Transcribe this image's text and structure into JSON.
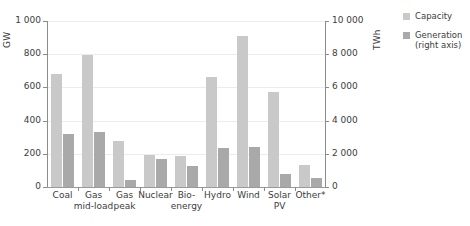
{
  "chart_data": {
    "type": "bar",
    "title": "",
    "xlabel": "",
    "categories": [
      "Coal",
      "Gas\nmid-load",
      "Gas\npeak",
      "Nuclear",
      "Bio-\nenergy",
      "Hydro",
      "Wind",
      "Solar\nPV",
      "Other*"
    ],
    "series": [
      {
        "name": "Capacity",
        "axis": "left",
        "unit": "GW",
        "color": "#c9c9c9",
        "values": [
          680,
          795,
          275,
          190,
          188,
          660,
          910,
          570,
          130
        ]
      },
      {
        "name": "Generation (right axis)",
        "axis": "right",
        "unit": "TWh",
        "color": "#a9a9a9",
        "values": [
          3200,
          3300,
          420,
          1700,
          1250,
          2350,
          2400,
          780,
          560
        ]
      }
    ],
    "left_axis": {
      "label": "GW",
      "ticks": [
        0,
        200,
        400,
        600,
        800,
        1000
      ],
      "tick_labels": [
        "0",
        "200",
        "400",
        "600",
        "800",
        "1 000"
      ],
      "ylim": [
        0,
        1000
      ]
    },
    "right_axis": {
      "label": "TWh",
      "ticks": [
        0,
        2000,
        4000,
        6000,
        8000,
        10000
      ],
      "tick_labels": [
        "0",
        "2 000",
        "4 000",
        "6 000",
        "8 000",
        "10 000"
      ],
      "ylim": [
        0,
        10000
      ]
    },
    "grid": true,
    "legend_position": "right",
    "legend": [
      {
        "label": "Capacity",
        "color": "#c9c9c9"
      },
      {
        "label": "Generation\n(right axis)",
        "color": "#a9a9a9"
      }
    ]
  }
}
